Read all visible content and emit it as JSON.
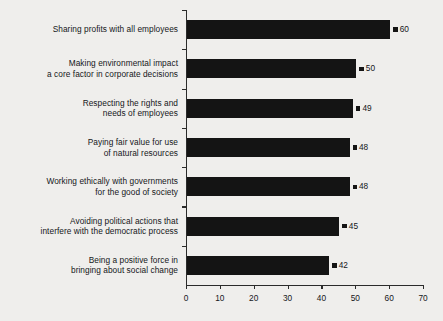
{
  "chart_data": {
    "type": "bar",
    "orientation": "horizontal",
    "title": "",
    "xlabel": "",
    "ylabel": "",
    "xlim": [
      0,
      70
    ],
    "xticks": [
      0,
      10,
      20,
      30,
      40,
      50,
      60,
      70
    ],
    "grid": false,
    "legend": null,
    "bar_color": "#141414",
    "background_color": "#efeeec",
    "text_color": "#15171a",
    "categories": [
      "Sharing profits with all employees",
      "Making environmental impact\na core factor in corporate decisions",
      "Respecting the rights and\nneeds of employees",
      "Paying fair value for use\nof natural resources",
      "Working ethically with governments\nfor the good of society",
      "Avoiding political actions that\ninterfere with the democratic process",
      "Being a positive force in\nbringing about social change"
    ],
    "values": [
      60,
      50,
      49,
      48,
      48,
      45,
      42
    ],
    "value_labels": [
      "60",
      "50",
      "49",
      "48",
      "48",
      "45",
      "42"
    ]
  }
}
